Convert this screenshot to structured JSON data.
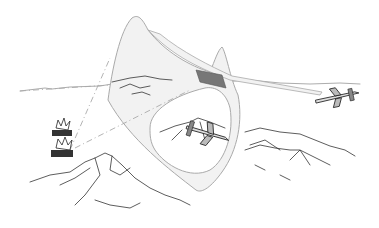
{
  "illustration": {
    "subject": "Two attack aircraft flying a looping flight path over mountainous terrain with ground targets exploding",
    "elements": [
      "flight-path-ribbon",
      "aircraft",
      "aircraft",
      "mountains",
      "tank-explosions",
      "line-of-sight"
    ],
    "colors": {
      "ribbon": "#f0f0f0",
      "ribbon_edge": "#aaaaaa",
      "highlight_segment": "#777777",
      "ink": "#333333"
    }
  }
}
